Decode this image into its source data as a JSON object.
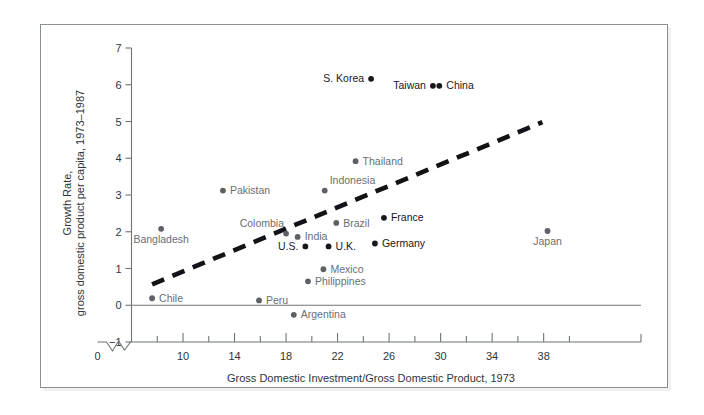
{
  "figure": {
    "background_color": "#ffffff",
    "frame_border_color": "#8a8f96"
  },
  "chart_data": {
    "type": "scatter",
    "title": "",
    "xlabel": "Gross Domestic Investment/Gross Domestic Product, 1973",
    "ylabel": "Growth Rate,\ngross domestic product per capita, 1973–1987",
    "ylabel_line1": "Growth Rate,",
    "ylabel_line2": "gross domestic product per capita, 1973–1987",
    "xlim": [
      6,
      40
    ],
    "ylim": [
      -1,
      7
    ],
    "x_ticks_major": [
      10,
      14,
      18,
      22,
      26,
      30,
      34,
      38
    ],
    "x_ticks_major_labels": [
      "10",
      "14",
      "18",
      "22",
      "26",
      "30",
      "34",
      "38"
    ],
    "x_ticks_minor": [
      8,
      12,
      16,
      20,
      24,
      28,
      32,
      36,
      40
    ],
    "x_origin_label": "0",
    "x_axis_break": true,
    "y_ticks": [
      -1,
      0,
      1,
      2,
      3,
      4,
      5,
      6,
      7
    ],
    "y_tick_labels": [
      "−1",
      "0",
      "1",
      "2",
      "3",
      "4",
      "5",
      "6",
      "7"
    ],
    "grid": false,
    "legend": null,
    "trend_line": {
      "style": "dashed",
      "color": "#111316",
      "x_start": 7.6,
      "y_start": 0.57,
      "x_end": 37.9,
      "y_end": 4.98
    },
    "points": [
      {
        "label": "S. Korea",
        "x": 24.6,
        "y": 6.16,
        "tone": "dark",
        "label_side": "left"
      },
      {
        "label": "Taiwan",
        "x": 29.4,
        "y": 5.97,
        "tone": "dark",
        "label_side": "left"
      },
      {
        "label": "China",
        "x": 29.9,
        "y": 5.97,
        "tone": "dark",
        "label_side": "right"
      },
      {
        "label": "Thailand",
        "x": 23.4,
        "y": 3.92,
        "tone": "gray",
        "label_side": "right"
      },
      {
        "label": "Pakistan",
        "x": 13.1,
        "y": 3.12,
        "tone": "gray",
        "label_side": "right"
      },
      {
        "label": "Indonesia",
        "x": 21.0,
        "y": 3.12,
        "tone": "gray",
        "label_side": "right-up"
      },
      {
        "label": "France",
        "x": 25.6,
        "y": 2.38,
        "tone": "dark",
        "label_side": "right"
      },
      {
        "label": "Brazil",
        "x": 21.9,
        "y": 2.24,
        "tone": "gray",
        "label_side": "right"
      },
      {
        "label": "Bangladesh",
        "x": 8.3,
        "y": 2.08,
        "tone": "gray",
        "label_side": "below"
      },
      {
        "label": "Japan",
        "x": 38.3,
        "y": 2.02,
        "tone": "gray",
        "label_side": "below"
      },
      {
        "label": "Colombia",
        "x": 18.0,
        "y": 1.95,
        "tone": "gray",
        "label_side": "left-up"
      },
      {
        "label": "India",
        "x": 18.9,
        "y": 1.86,
        "tone": "gray",
        "label_side": "right"
      },
      {
        "label": "Germany",
        "x": 24.9,
        "y": 1.68,
        "tone": "dark",
        "label_side": "right"
      },
      {
        "label": "U.S.",
        "x": 19.5,
        "y": 1.6,
        "tone": "dark",
        "label_side": "left"
      },
      {
        "label": "U.K.",
        "x": 21.3,
        "y": 1.6,
        "tone": "dark",
        "label_side": "right"
      },
      {
        "label": "Mexico",
        "x": 20.9,
        "y": 0.98,
        "tone": "gray",
        "label_side": "right"
      },
      {
        "label": "Philippines",
        "x": 19.7,
        "y": 0.65,
        "tone": "gray",
        "label_side": "right"
      },
      {
        "label": "Chile",
        "x": 7.6,
        "y": 0.19,
        "tone": "gray",
        "label_side": "right"
      },
      {
        "label": "Peru",
        "x": 15.9,
        "y": 0.13,
        "tone": "gray",
        "label_side": "right"
      },
      {
        "label": "Argentina",
        "x": 18.6,
        "y": -0.26,
        "tone": "gray",
        "label_side": "right"
      }
    ]
  }
}
